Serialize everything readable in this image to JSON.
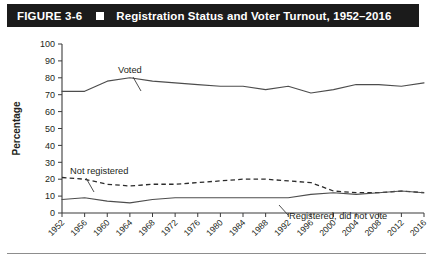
{
  "header": {
    "figure_number": "FIGURE 3-6",
    "marker_icon": "black-square-icon",
    "title": "Registration Status and Voter Turnout, 1952–2016"
  },
  "chart_data": {
    "type": "line",
    "title": "Registration Status and Voter Turnout, 1952–2016",
    "xlabel": "",
    "ylabel": "Percentage",
    "ylim": [
      0,
      100
    ],
    "ytick_step": 10,
    "yticks": [
      0,
      10,
      20,
      30,
      40,
      50,
      60,
      70,
      80,
      90,
      100
    ],
    "grid": false,
    "legend_position": "inline-annotations",
    "categories": [
      1952,
      1956,
      1960,
      1964,
      1968,
      1972,
      1976,
      1980,
      1984,
      1988,
      1992,
      1996,
      2000,
      2004,
      2008,
      2012,
      2016
    ],
    "xtick_labels": [
      "1952",
      "1956",
      "1960",
      "1964",
      "1968",
      "1972",
      "1976",
      "1980",
      "1984",
      "1988",
      "1992",
      "1996",
      "2000",
      "2004",
      "2008",
      "2012",
      "2016"
    ],
    "series": [
      {
        "name": "Voted",
        "style": "solid",
        "color": "#4d4d4d",
        "annotation": "Voted",
        "values": [
          72,
          72,
          78,
          80,
          78,
          77,
          76,
          75,
          75,
          73,
          75,
          71,
          73,
          76,
          76,
          75,
          77
        ]
      },
      {
        "name": "Not registered",
        "style": "dashed",
        "color": "#2b2b2b",
        "annotation": "Not registered",
        "values": [
          21,
          20,
          17,
          16,
          17,
          17,
          18,
          19,
          20,
          20,
          19,
          18,
          13,
          12,
          12,
          13,
          12
        ]
      },
      {
        "name": "Registered, did not vote",
        "style": "solid",
        "color": "#4d4d4d",
        "annotation": "Registered, did not vote",
        "values": [
          8,
          9,
          7,
          6,
          8,
          9,
          9,
          9,
          9,
          9,
          9,
          11,
          12,
          11,
          12,
          13,
          12
        ]
      }
    ]
  }
}
